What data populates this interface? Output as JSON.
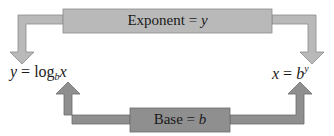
{
  "diagram": {
    "top_box": {
      "text": "Exponent",
      "equals": "=",
      "var": "y",
      "color": "#b9b9b9"
    },
    "bottom_box": {
      "text": "Base",
      "equals": "=",
      "var": "b",
      "color": "#8f8f8f"
    },
    "left_formula": {
      "lhs": "y",
      "equals": "=",
      "func": "log",
      "sub": "b",
      "arg": "x"
    },
    "right_formula": {
      "lhs": "x",
      "equals": "=",
      "base": "b",
      "exp": "y"
    },
    "arrows": [
      {
        "from": "top_box",
        "to": "left_formula",
        "direction": "down"
      },
      {
        "from": "top_box",
        "to": "right_formula",
        "direction": "down"
      },
      {
        "from": "bottom_box",
        "to": "left_formula",
        "direction": "up"
      },
      {
        "from": "bottom_box",
        "to": "right_formula",
        "direction": "up"
      }
    ]
  }
}
